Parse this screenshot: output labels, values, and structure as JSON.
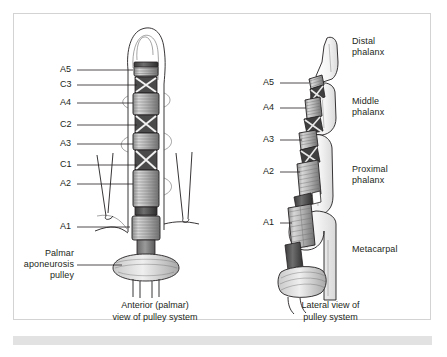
{
  "figure": {
    "title_visible": false,
    "border_color": "#d3d3d3",
    "background": "#ffffff",
    "ink_color": "#231f20",
    "footer_strip_color": "#e2e2e2"
  },
  "left_panel": {
    "caption": "Anterior (palmar)\nview of pulley system",
    "labels": [
      {
        "text": "A5",
        "x": 62,
        "y": 65,
        "line_from_x": 77,
        "line_to_x": 133,
        "line_y": 70
      },
      {
        "text": "C3",
        "x": 62,
        "y": 80,
        "line_from_x": 77,
        "line_to_x": 137,
        "line_y": 85
      },
      {
        "text": "A4",
        "x": 62,
        "y": 98,
        "line_from_x": 77,
        "line_to_x": 133,
        "line_y": 103
      },
      {
        "text": "C2",
        "x": 62,
        "y": 120,
        "line_from_x": 77,
        "line_to_x": 137,
        "line_y": 125
      },
      {
        "text": "A3",
        "x": 62,
        "y": 139,
        "line_from_x": 77,
        "line_to_x": 133,
        "line_y": 144
      },
      {
        "text": "C1",
        "x": 62,
        "y": 160,
        "line_from_x": 77,
        "line_to_x": 137,
        "line_y": 165
      },
      {
        "text": "A2",
        "x": 62,
        "y": 179,
        "line_from_x": 77,
        "line_to_x": 133,
        "line_y": 184
      },
      {
        "text": "A1",
        "x": 62,
        "y": 222,
        "line_from_x": 77,
        "line_to_x": 130,
        "line_y": 227
      }
    ],
    "palmar_label": "Palmar\naponeurosis\npulley"
  },
  "right_panel": {
    "caption": "Lateral view of\npulley system",
    "labels": [
      {
        "text": "A5",
        "x": 265,
        "y": 78,
        "line_from_x": 280,
        "line_to_x": 309,
        "line_y": 83
      },
      {
        "text": "A4",
        "x": 265,
        "y": 103,
        "line_from_x": 280,
        "line_to_x": 306,
        "line_y": 108
      },
      {
        "text": "A3",
        "x": 265,
        "y": 135,
        "line_from_x": 280,
        "line_to_x": 304,
        "line_y": 140
      },
      {
        "text": "A2",
        "x": 265,
        "y": 167,
        "line_from_x": 280,
        "line_to_x": 302,
        "line_y": 172
      },
      {
        "text": "A1",
        "x": 265,
        "y": 218,
        "line_from_x": 280,
        "line_to_x": 296,
        "line_y": 223
      }
    ],
    "bone_labels": [
      {
        "text": "Distal\nphalanx",
        "x": 352,
        "y": 40
      },
      {
        "text": "Middle\nphalanx",
        "x": 352,
        "y": 100
      },
      {
        "text": "Proximal\nphalanx",
        "x": 352,
        "y": 168
      },
      {
        "text": "Metacarpal",
        "x": 352,
        "y": 248
      }
    ]
  },
  "anatomy": {
    "diagram_type": "anatomical-illustration",
    "subject": "finger flexor tendon pulley system",
    "pulleys_annular": [
      "A1",
      "A2",
      "A3",
      "A4",
      "A5"
    ],
    "pulleys_cruciate": [
      "C1",
      "C2",
      "C3"
    ],
    "bones": [
      "Distal phalanx",
      "Middle phalanx",
      "Proximal phalanx",
      "Metacarpal"
    ],
    "views": [
      "Anterior (palmar)",
      "Lateral"
    ]
  }
}
